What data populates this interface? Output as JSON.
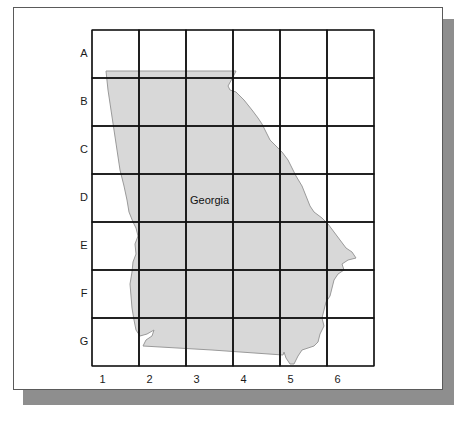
{
  "map": {
    "state_name": "Georgia",
    "fill_color": "#d8d8d8",
    "outline_color": "#9a9a9a",
    "grid_color": "#111111",
    "shadow_color": "#8e8e8e",
    "grid": {
      "rows": [
        "A",
        "B",
        "C",
        "D",
        "E",
        "F",
        "G"
      ],
      "columns": [
        "1",
        "2",
        "3",
        "4",
        "5",
        "6"
      ]
    }
  }
}
